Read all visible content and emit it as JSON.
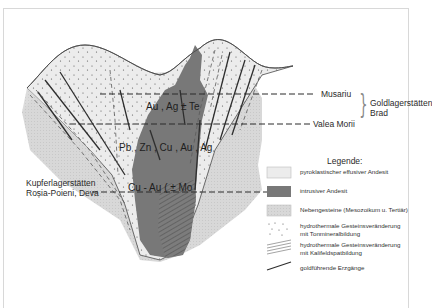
{
  "diagram": {
    "type": "geological-cross-section",
    "levels": [
      {
        "name": "Musariu",
        "y": 94
      },
      {
        "name": "Valea Morii",
        "y": 124
      },
      {
        "name": "Kupferlagerstätten Roșia-Poieni, Deva",
        "y": 192
      }
    ],
    "group_label": {
      "line1": "Goldlagerstätten",
      "line2": "Brad"
    },
    "left_label": {
      "line1": "Kupferlagerstätten",
      "line2": "Roșia-Poieni, Deva"
    },
    "mineral_zones": [
      {
        "label": "Au , Ag ± Te"
      },
      {
        "label": "Pb , Zn , Cu , Au , Ag"
      },
      {
        "label": "Cu - Au  ( ± Mo"
      }
    ]
  },
  "legend": {
    "title": "Legende:",
    "items": [
      {
        "symbol": "light-fill",
        "label": "pyroklastischer effusiver Andesit",
        "color": "#e8e8e8"
      },
      {
        "symbol": "dark-fill",
        "label": "intrusiver Andesit",
        "color": "#7a7a7a"
      },
      {
        "symbol": "dotted-fill",
        "label": "Nebengesteine (Mesozoikum u. Tertiär)",
        "color": "#d4d4d4"
      },
      {
        "symbol": "dots-pattern",
        "label_line1": "hydrothermale Gesteinsveränderung",
        "label_line2": "mit Tonmineralbildung"
      },
      {
        "symbol": "hatch-pattern",
        "label_line1": "hydrothermale Gesteinsveränderung",
        "label_line2": "mit Kalifeldspatbildung"
      },
      {
        "symbol": "line",
        "label": "goldführende Erzgänge"
      }
    ]
  },
  "colors": {
    "background": "#ffffff",
    "host_rock": "#d6d6d6",
    "pyroclastic": "#ececec",
    "intrusive": "#787878",
    "line": "#3a3a3a",
    "frame": "#d8d8d8"
  }
}
